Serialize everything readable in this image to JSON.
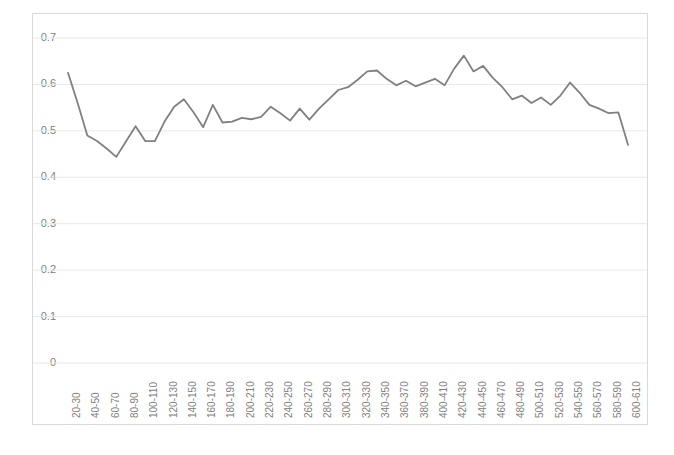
{
  "chart_data": {
    "type": "line",
    "title": "",
    "subtitle": "",
    "xlabel": "",
    "ylabel": "",
    "grid": true,
    "legend": false,
    "legend_position": "none",
    "line_color": "#808080",
    "gridline_color": "#e8e8e8",
    "border_color": "#d9d9d9",
    "background_color": "#ffffff",
    "axis_text_color": "#808080",
    "ylim": [
      0,
      0.7
    ],
    "ytick_labels": [
      "0.7",
      "0.6",
      "0.5",
      "0.4",
      "0.3",
      "0.2",
      "0.1",
      "0"
    ],
    "ytick_values": [
      0.7,
      0.6,
      0.5,
      0.4,
      0.3,
      0.2,
      0.1,
      0
    ],
    "xtick_labels": [
      "20-30",
      "40-50",
      "60-70",
      "80-90",
      "100-110",
      "120-130",
      "140-150",
      "160-170",
      "180-190",
      "200-210",
      "220-230",
      "240-250",
      "260-270",
      "280-290",
      "300-310",
      "320-330",
      "340-350",
      "360-370",
      "380-390",
      "400-410",
      "420-430",
      "440-450",
      "460-470",
      "480-490",
      "500-510",
      "520-530",
      "540-550",
      "560-570",
      "580-590",
      "600-610"
    ],
    "categories": [
      "20-30",
      "30-40",
      "40-50",
      "50-60",
      "60-70",
      "70-80",
      "80-90",
      "90-100",
      "100-110",
      "110-120",
      "120-130",
      "130-140",
      "140-150",
      "150-160",
      "160-170",
      "170-180",
      "180-190",
      "190-200",
      "200-210",
      "210-220",
      "220-230",
      "230-240",
      "240-250",
      "250-260",
      "260-270",
      "270-280",
      "280-290",
      "290-300",
      "300-310",
      "310-320",
      "320-330",
      "330-340",
      "340-350",
      "350-360",
      "360-370",
      "370-380",
      "380-390",
      "390-400",
      "400-410",
      "410-420",
      "420-430",
      "430-440",
      "440-450",
      "450-460",
      "460-470",
      "470-480",
      "480-490",
      "490-500",
      "500-510",
      "510-520",
      "520-530",
      "530-540",
      "540-550",
      "550-560",
      "560-570",
      "570-580",
      "580-590",
      "590-600",
      "600-610"
    ],
    "values": [
      0.625,
      0.56,
      0.49,
      0.478,
      0.462,
      0.444,
      0.477,
      0.51,
      0.478,
      0.478,
      0.52,
      0.552,
      0.568,
      0.54,
      0.508,
      0.556,
      0.518,
      0.52,
      0.528,
      0.525,
      0.53,
      0.552,
      0.538,
      0.522,
      0.548,
      0.524,
      0.548,
      0.568,
      0.588,
      0.594,
      0.61,
      0.628,
      0.63,
      0.612,
      0.598,
      0.608,
      0.596,
      0.604,
      0.612,
      0.598,
      0.634,
      0.662,
      0.628,
      0.64,
      0.614,
      0.594,
      0.568,
      0.576,
      0.56,
      0.572,
      0.556,
      0.576,
      0.604,
      0.582,
      0.556,
      0.548,
      0.538,
      0.54,
      0.47
    ]
  },
  "axis": {
    "y_title": "",
    "x_title": ""
  }
}
